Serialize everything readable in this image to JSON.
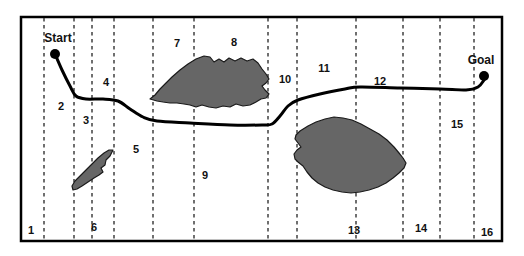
{
  "figure": {
    "type": "path-planning-map",
    "background_color": "#ffffff",
    "border_color": "#000000",
    "obstacle_fill": "#666666",
    "obstacle_stroke": "#1a1a1a",
    "path_color": "#000000",
    "divider_color": "#333333",
    "frame": {
      "x": 21,
      "y": 17,
      "width": 481,
      "height": 224
    }
  },
  "endpoints": [
    {
      "name": "start",
      "label": "Start",
      "label_x": 58,
      "label_y": 38,
      "dot_x": 55,
      "dot_y": 54
    },
    {
      "name": "goal",
      "label": "Goal",
      "label_x": 481,
      "label_y": 60,
      "dot_x": 484,
      "dot_y": 76
    }
  ],
  "dividers": [
    {
      "x": 44
    },
    {
      "x": 74
    },
    {
      "x": 92
    },
    {
      "x": 114
    },
    {
      "x": 153
    },
    {
      "x": 194
    },
    {
      "x": 268
    },
    {
      "x": 297
    },
    {
      "x": 356
    },
    {
      "x": 403
    },
    {
      "x": 440
    },
    {
      "x": 474
    }
  ],
  "zones": [
    {
      "label": "1",
      "x": 31,
      "y": 230
    },
    {
      "label": "2",
      "x": 61,
      "y": 106
    },
    {
      "label": "3",
      "x": 86,
      "y": 120
    },
    {
      "label": "4",
      "x": 106,
      "y": 82
    },
    {
      "label": "5",
      "x": 136,
      "y": 149
    },
    {
      "label": "6",
      "x": 94,
      "y": 227
    },
    {
      "label": "7",
      "x": 177,
      "y": 43
    },
    {
      "label": "8",
      "x": 234,
      "y": 42
    },
    {
      "label": "9",
      "x": 205,
      "y": 175
    },
    {
      "label": "10",
      "x": 285,
      "y": 79
    },
    {
      "label": "11",
      "x": 324,
      "y": 68
    },
    {
      "label": "12",
      "x": 380,
      "y": 81
    },
    {
      "label": "13",
      "x": 354,
      "y": 230
    },
    {
      "label": "14",
      "x": 421,
      "y": 228
    },
    {
      "label": "15",
      "x": 457,
      "y": 124
    },
    {
      "label": "16",
      "x": 487,
      "y": 232
    }
  ],
  "obstacles": [
    {
      "name": "obstacle-upper-center",
      "bbox": [
        150,
        55,
        120,
        53
      ]
    },
    {
      "name": "obstacle-lower-left",
      "bbox": [
        72,
        149,
        42,
        42
      ]
    },
    {
      "name": "obstacle-lower-right",
      "bbox": [
        294,
        117,
        112,
        77
      ]
    }
  ],
  "path": {
    "name": "planned-route",
    "stroke_width": 3,
    "waypoints": [
      [
        55,
        54
      ],
      [
        62,
        70
      ],
      [
        70,
        86
      ],
      [
        76,
        96
      ],
      [
        86,
        99
      ],
      [
        103,
        99
      ],
      [
        118,
        101
      ],
      [
        130,
        109
      ],
      [
        143,
        117
      ],
      [
        157,
        121
      ],
      [
        190,
        123
      ],
      [
        230,
        125
      ],
      [
        262,
        125
      ],
      [
        272,
        124
      ],
      [
        280,
        116
      ],
      [
        288,
        106
      ],
      [
        298,
        100
      ],
      [
        320,
        94
      ],
      [
        345,
        89
      ],
      [
        360,
        87
      ],
      [
        400,
        88
      ],
      [
        440,
        89
      ],
      [
        466,
        90
      ],
      [
        478,
        87
      ],
      [
        484,
        80
      ]
    ]
  }
}
